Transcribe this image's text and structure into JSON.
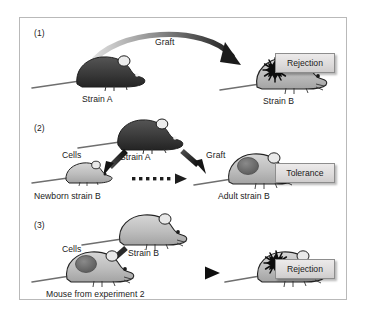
{
  "figure": {
    "border_color": "#b9b9b9",
    "background": "#ffffff"
  },
  "colors": {
    "strain_a_body": "#3c3c3c",
    "strain_b_body": "#bdbdbd",
    "graft_rejected": "#111111",
    "graft_accepted": "#6b6b6b",
    "arrow_dark": "#222222",
    "arrow_light": "#cfcfcf",
    "result_box_fill": "#e2e0e0",
    "result_box_border": "#8d8d8d",
    "outline": "#2b2b2b"
  },
  "panels": [
    {
      "number": "(1)",
      "arrow_label": "Graft",
      "donor_label": "Strain A",
      "recipient_label": "Strain B",
      "result": "Rejection",
      "donor_icon": "dark-mouse-icon",
      "recipient_icon": "light-mouse-with-rejected-graft-icon",
      "arrow_icon": "curved-graft-arrow-icon"
    },
    {
      "number": "(2)",
      "cells_label": "Cells",
      "donor_label": "Strain A",
      "graft_label": "Graft",
      "newborn_label": "Newborn strain B",
      "adult_label": "Adult strain B",
      "result": "Tolerance",
      "donor_icon": "dark-mouse-icon",
      "newborn_icon": "small-light-mouse-icon",
      "adult_icon": "light-mouse-with-accepted-graft-icon",
      "cells_arrow_icon": "diagonal-cells-arrow-icon",
      "graft_arrow_icon": "diagonal-graft-arrow-icon",
      "growth_arrow_icon": "dotted-growth-arrow-icon"
    },
    {
      "number": "(3)",
      "cells_label": "Cells",
      "donor_label": "Strain B",
      "recipient_label": "Mouse from experiment 2",
      "result": "Rejection",
      "donor_icon": "light-mouse-icon",
      "recipient_icon": "light-mouse-with-accepted-graft-icon",
      "outcome_icon": "light-mouse-with-rejected-graft-icon",
      "cells_arrow_icon": "diagonal-cells-arrow-icon",
      "outcome_arrow_icon": "horizontal-graft-arrow-icon"
    }
  ]
}
